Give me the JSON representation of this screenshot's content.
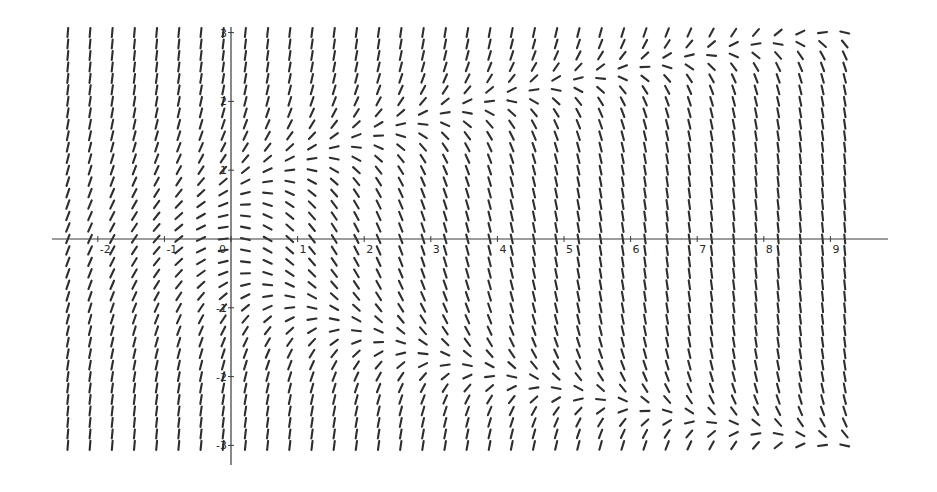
{
  "chart_data": {
    "type": "slope_field",
    "title": "",
    "equation": "dy/dx = y^2 - x",
    "xlabel": "",
    "ylabel": "",
    "xlim": [
      -2.7,
      9.8
    ],
    "ylim": [
      -3.3,
      3.1
    ],
    "grid": false,
    "legend": null,
    "x_ticks": [
      {
        "value": -2,
        "label": "-2"
      },
      {
        "value": -1,
        "label": "-1"
      },
      {
        "value": 0,
        "label": "0"
      },
      {
        "value": 1,
        "label": "1"
      },
      {
        "value": 2,
        "label": "2"
      },
      {
        "value": 3,
        "label": "3"
      },
      {
        "value": 4,
        "label": "4"
      },
      {
        "value": 5,
        "label": "5"
      },
      {
        "value": 6,
        "label": "6"
      },
      {
        "value": 7,
        "label": "7"
      },
      {
        "value": 8,
        "label": "8"
      },
      {
        "value": 9,
        "label": "9"
      }
    ],
    "y_ticks": [
      {
        "value": 3,
        "label": "3"
      },
      {
        "value": 2,
        "label": "2"
      },
      {
        "value": 1,
        "label": "1"
      },
      {
        "value": -1,
        "label": "-1"
      },
      {
        "value": -2,
        "label": "-2"
      },
      {
        "value": -3,
        "label": "-3"
      }
    ],
    "field_grid": {
      "x_start": -2.45,
      "x_step": 0.3333,
      "x_count": 36,
      "y_start": -3.0,
      "y_step": 0.1667,
      "y_count": 37
    },
    "horizontal_slope_curve": "y^2 = x (nullcline: y = ±sqrt(x))",
    "nullcline_points": [
      [
        0,
        0
      ],
      [
        1,
        1
      ],
      [
        4,
        2
      ],
      [
        9,
        3
      ],
      [
        1,
        -1
      ],
      [
        4,
        -2
      ],
      [
        9,
        -3
      ]
    ]
  },
  "layout": {
    "origin_px": [
      231,
      239
    ],
    "px_per_unit_x": 66.6,
    "px_per_unit_y": 68.8,
    "x_axis_px": [
      52,
      888
    ],
    "y_axis_px": [
      27,
      465
    ],
    "segment_length_px": 9,
    "color": "#2e2e2e"
  }
}
